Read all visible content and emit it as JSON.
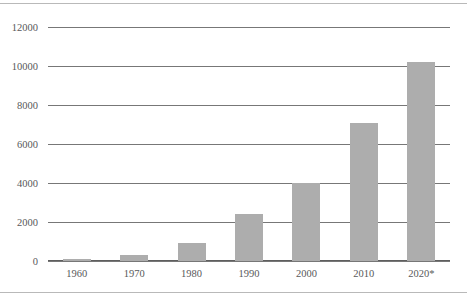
{
  "chart_data": {
    "type": "bar",
    "title": "",
    "subtitle": "",
    "xlabel": "",
    "ylabel": "",
    "categories": [
      "1960",
      "1970",
      "1980",
      "1990",
      "2000",
      "2010",
      "2020*"
    ],
    "values": [
      120,
      300,
      920,
      2400,
      4000,
      7100,
      10200
    ],
    "ylim": [
      0,
      12000
    ],
    "ytick_labels": [
      "0",
      "2000",
      "4000",
      "6000",
      "8000",
      "10000",
      "12000"
    ],
    "ytick_values": [
      0,
      2000,
      4000,
      6000,
      8000,
      10000,
      12000
    ],
    "grid": true,
    "legend": false,
    "legend_position": "none",
    "annotations": [],
    "colors": {
      "bar": "#adadad",
      "gridline": "#777777",
      "axis": "#5e5e5e",
      "text": "#58585a",
      "background": "#ffffff",
      "page_rule": "#b9b9b9"
    }
  }
}
